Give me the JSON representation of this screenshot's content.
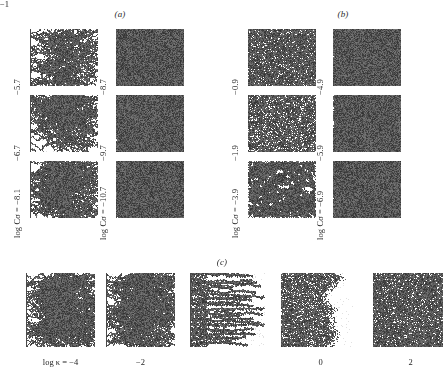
{
  "figure": {
    "background_color": "#ffffff",
    "ink_color": "#555555",
    "width": 447,
    "height": 385
  },
  "groups": [
    {
      "id": "a",
      "caption": "(a)",
      "caption_x": 112,
      "caption_y": 9,
      "columns": [
        {
          "id": "a-col1",
          "axis_label_prefix": "log C",
          "axis_label_symbol": "σ",
          "axis_label_equals": " = ",
          "rows": [
            {
              "label": "−5.7",
              "full_label": "−5.7",
              "pattern": "sparse-dla",
              "density": 0.1,
              "seed_line": true
            },
            {
              "label": "−6.7",
              "full_label": "−6.7",
              "pattern": "sparse-dla",
              "density": 0.13,
              "seed_line": true
            },
            {
              "label": "log Cσ = −8.1",
              "full_label": "log Cσ = −8.1",
              "pattern": "sparse-dla",
              "density": 0.16,
              "seed_line": true
            }
          ]
        },
        {
          "id": "a-col2",
          "rows": [
            {
              "label": "−8.7",
              "full_label": "−8.7",
              "pattern": "dense-dla",
              "density": 0.34,
              "seed_line": false
            },
            {
              "label": "−9.7",
              "full_label": "−9.7",
              "pattern": "dense-dla",
              "density": 0.33,
              "seed_line": false
            },
            {
              "label": "log Cσ = −10.7",
              "full_label": "log Cσ = −10.7",
              "pattern": "dense-dla",
              "density": 0.35,
              "seed_line": false
            }
          ]
        }
      ]
    },
    {
      "id": "b",
      "caption": "(b)",
      "caption_x": 335,
      "caption_y": 9,
      "columns": [
        {
          "id": "b-col1",
          "rows": [
            {
              "label": "−0.9",
              "full_label": "−0.9",
              "pattern": "saturated",
              "density": 0.93,
              "seed_line": false
            },
            {
              "label": "−1.9",
              "full_label": "−1.9",
              "pattern": "saturated",
              "density": 0.88,
              "seed_line": false
            },
            {
              "label": "log Cσ = −3.9",
              "full_label": "log Cσ = −3.9",
              "pattern": "percolation",
              "density": 0.55,
              "seed_line": false
            }
          ]
        },
        {
          "id": "b-col2",
          "rows": [
            {
              "label": "−4.9",
              "full_label": "−4.9",
              "pattern": "dense-dla",
              "density": 0.36,
              "seed_line": false
            },
            {
              "label": "−5.9",
              "full_label": "−5.9",
              "pattern": "dense-dla",
              "density": 0.34,
              "seed_line": false
            },
            {
              "label": "log Cσ = −6.9",
              "full_label": "log Cσ = −6.9",
              "pattern": "dense-dla",
              "density": 0.33,
              "seed_line": false
            }
          ]
        }
      ]
    },
    {
      "id": "c",
      "caption": "(c)",
      "caption_x": 214,
      "caption_y": 257,
      "columns": [
        {
          "id": "c-1",
          "label": "log κ = −4",
          "label_prefix": "log ",
          "label_symbol": "κ",
          "label_value": " = −4",
          "pattern": "sparse-dla",
          "density": 0.11,
          "seed_line": true
        },
        {
          "id": "c-2",
          "label": "−2",
          "label_prefix": "",
          "label_symbol": "",
          "label_value": "−2",
          "pattern": "sparse-dla",
          "density": 0.16,
          "seed_line": true
        },
        {
          "id": "c-3",
          "label": "−1",
          "label_prefix": "",
          "label_symbol": "",
          "label_value": "−1",
          "pattern": "striped-dla",
          "density": 0.33,
          "seed_line": true
        },
        {
          "id": "c-4",
          "label": "0",
          "label_prefix": "",
          "label_symbol": "",
          "label_value": "0",
          "pattern": "rough-front",
          "density": 0.74,
          "seed_line": false
        },
        {
          "id": "c-5",
          "label": "2",
          "label_prefix": "",
          "label_symbol": "",
          "label_value": "2",
          "pattern": "saturated",
          "density": 0.92,
          "seed_line": false
        }
      ]
    }
  ],
  "axis_labels": {
    "log_c_sigma": "log Cσ",
    "log_kappa": "log κ"
  }
}
